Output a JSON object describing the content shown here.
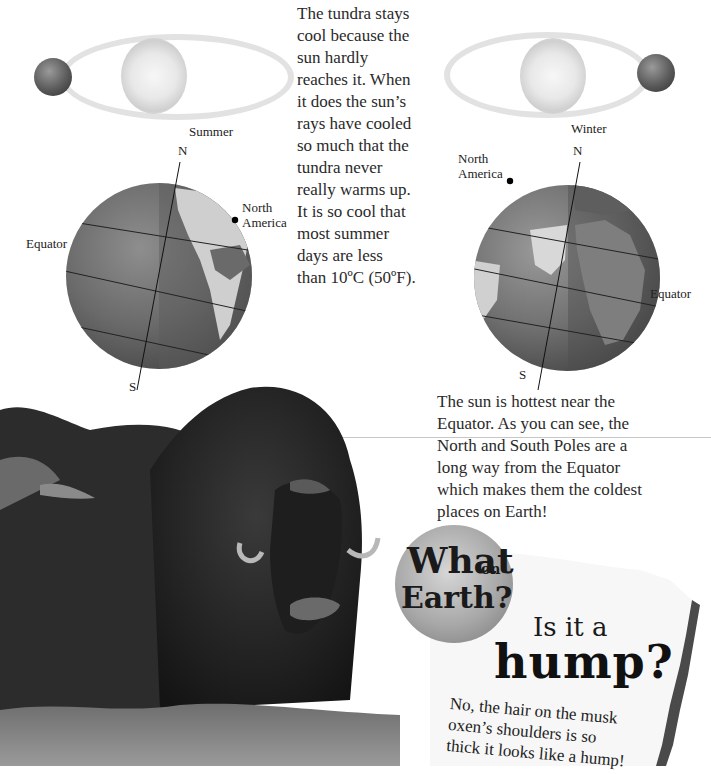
{
  "summer_diagram": {
    "season_label": "Summer",
    "north_label": "N",
    "south_label": "S",
    "equator_label": "Equator",
    "continent_label_line1": "North",
    "continent_label_line2": "America"
  },
  "winter_diagram": {
    "season_label": "Winter",
    "north_label": "N",
    "south_label": "S",
    "equator_label": "Equator",
    "continent_label_line1": "North",
    "continent_label_line2": "America"
  },
  "tundra_paragraph": {
    "lines": [
      "The tundra stays",
      "cool because the",
      "sun hardly",
      "reaches it. When",
      "it does the sun’s",
      "rays have cooled",
      "so much that the",
      "tundra never",
      "really warms up.",
      "It is so cool that",
      "most summer",
      "days are less",
      "than 10ºC (50ºF)."
    ]
  },
  "equator_paragraph": {
    "lines": [
      "The sun is hottest near the",
      "Equator. As you can see, the",
      "North and South Poles are a",
      "long way from the Equator",
      "which makes them the coldest",
      "places on Earth!"
    ]
  },
  "what_on_earth_box": {
    "badge_line1": "What",
    "badge_small": "on",
    "badge_line2": "Earth?",
    "question_line1": "Is it a",
    "question_line2": "hump?",
    "answer_lines": [
      "No, the hair on the musk",
      "oxen’s shoulders is so",
      "thick it looks like a hump!"
    ]
  },
  "photo": {
    "subject": "musk oxen"
  },
  "colors": {
    "ocean": "#6e6e6e",
    "land": "#c9c9c9",
    "orbit": "#e2e2e2",
    "text": "#2a2a2a",
    "torn_edge": "#4a4a4a"
  }
}
